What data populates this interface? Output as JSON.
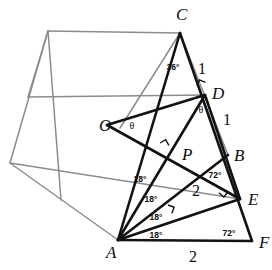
{
  "figure": {
    "background_color": "#ffffff",
    "stroke_color": "#121212",
    "faint_stroke_color": "#8c8c8c"
  },
  "vertices": [
    {
      "id": "C",
      "label": "C",
      "x": 180,
      "y": 33,
      "label_x": 176,
      "label_y": 20
    },
    {
      "id": "D",
      "label": "D",
      "x": 205,
      "y": 95,
      "label_x": 212,
      "label_y": 99
    },
    {
      "id": "O",
      "label": "O",
      "x": 107,
      "y": 125,
      "label_x": 99,
      "label_y": 131
    },
    {
      "id": "P",
      "label": "P",
      "x": 177,
      "y": 152,
      "label_x": 182,
      "label_y": 160
    },
    {
      "id": "B",
      "label": "B",
      "x": 228,
      "y": 155,
      "label_x": 234,
      "label_y": 161
    },
    {
      "id": "E",
      "label": "E",
      "x": 240,
      "y": 199,
      "label_x": 248,
      "label_y": 205
    },
    {
      "id": "A",
      "label": "A",
      "x": 118,
      "y": 240,
      "label_x": 106,
      "label_y": 258
    },
    {
      "id": "F",
      "label": "F",
      "x": 252,
      "y": 241,
      "label_x": 259,
      "label_y": 248
    }
  ],
  "side_lengths": [
    {
      "id": "CD",
      "value": "1",
      "x": 202,
      "y": 74
    },
    {
      "id": "DB",
      "value": "1",
      "x": 227,
      "y": 125
    },
    {
      "id": "BE-region",
      "value": "2",
      "x": 196,
      "y": 196
    },
    {
      "id": "AF",
      "value": "2",
      "x": 193,
      "y": 262
    }
  ],
  "angles": [
    {
      "id": "angle-ACD",
      "value": "36°",
      "x": 173,
      "y": 70
    },
    {
      "id": "angle-ODA-theta",
      "value": "θ",
      "x": 201,
      "y": 113
    },
    {
      "id": "angle-AOD-theta",
      "value": "θ",
      "x": 132,
      "y": 129
    },
    {
      "id": "angle-CAD",
      "value": "18°",
      "x": 140,
      "y": 182
    },
    {
      "id": "angle-DAB",
      "value": "18°",
      "x": 151,
      "y": 202
    },
    {
      "id": "angle-BAE",
      "value": "18°",
      "x": 156,
      "y": 220
    },
    {
      "id": "angle-EAF",
      "value": "18°",
      "x": 156,
      "y": 238
    },
    {
      "id": "angle-at-B",
      "value": "72°",
      "x": 215,
      "y": 178
    },
    {
      "id": "angle-at-F",
      "value": "72°",
      "x": 229,
      "y": 236
    }
  ],
  "right_angle_marks": [
    {
      "id": "right-angle-at-D",
      "x": 197,
      "y": 86,
      "rotation": -68
    },
    {
      "id": "right-angle-at-P",
      "x": 160,
      "y": 143,
      "rotation": -30
    },
    {
      "id": "right-angle-at-E",
      "x": 228,
      "y": 192,
      "rotation": 130
    },
    {
      "id": "right-angle-on-AE",
      "x": 168,
      "y": 205,
      "rotation": 20
    }
  ],
  "bold_segments": [
    {
      "id": "C-to-A",
      "x1": 180,
      "y1": 33,
      "x2": 118,
      "y2": 240
    },
    {
      "id": "C-to-F",
      "x1": 180,
      "y1": 33,
      "x2": 252,
      "y2": 241
    },
    {
      "id": "A-to-F",
      "x1": 118,
      "y1": 240,
      "x2": 252,
      "y2": 241
    },
    {
      "id": "A-to-D",
      "x1": 118,
      "y1": 240,
      "x2": 205,
      "y2": 95
    },
    {
      "id": "A-to-B",
      "x1": 118,
      "y1": 240,
      "x2": 228,
      "y2": 155
    },
    {
      "id": "A-to-E",
      "x1": 118,
      "y1": 240,
      "x2": 240,
      "y2": 199
    },
    {
      "id": "D-to-E",
      "x1": 205,
      "y1": 95,
      "x2": 240,
      "y2": 199
    },
    {
      "id": "O-to-D",
      "x1": 107,
      "y1": 125,
      "x2": 205,
      "y2": 95
    },
    {
      "id": "O-to-E",
      "x1": 107,
      "y1": 125,
      "x2": 240,
      "y2": 199
    }
  ],
  "faint_segments": [
    {
      "id": "poly-top-edge",
      "x1": 48,
      "y1": 31,
      "x2": 180,
      "y2": 33
    },
    {
      "id": "poly-left-upper-edge",
      "x1": 48,
      "y1": 31,
      "x2": 10,
      "y2": 163
    },
    {
      "id": "poly-left-lower-edge",
      "x1": 10,
      "y1": 163,
      "x2": 118,
      "y2": 240
    },
    {
      "id": "poly-inner-vertical",
      "x1": 48,
      "y1": 31,
      "x2": 61,
      "y2": 200
    },
    {
      "id": "poly-inner-diagonal",
      "x1": 28,
      "y1": 97,
      "x2": 205,
      "y2": 95
    },
    {
      "id": "poly-chord-left",
      "x1": 10,
      "y1": 163,
      "x2": 240,
      "y2": 199
    },
    {
      "id": "C-to-inner-lower",
      "x1": 180,
      "y1": 33,
      "x2": 120,
      "y2": 128
    },
    {
      "id": "C-to-B-faint",
      "x1": 180,
      "y1": 33,
      "x2": 228,
      "y2": 155
    },
    {
      "id": "left-vertex-spur",
      "x1": 28,
      "y1": 97,
      "x2": 48,
      "y2": 31
    }
  ]
}
